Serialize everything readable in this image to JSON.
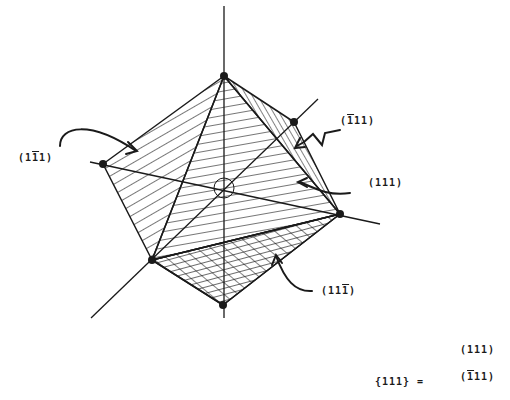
{
  "diagram": {
    "type": "octahedron-crystal-faces",
    "face_labels": {
      "left": {
        "pre": "(1",
        "bar": "1",
        "post": "1)"
      },
      "upper_right": {
        "pre": "(",
        "bar": "1",
        "post": "11)"
      },
      "right": {
        "text": "(111)"
      },
      "bottom": {
        "pre": "(11",
        "bar": "1",
        "post": ")"
      }
    },
    "equation": {
      "lhs": "{111} =",
      "rows": [
        {
          "pre": "(111)",
          "bar": "",
          "post": ""
        },
        {
          "pre": "(",
          "bar": "1",
          "post": "11)"
        }
      ]
    },
    "colors": {
      "ink": "#1a1a1a",
      "background": "#ffffff"
    }
  }
}
